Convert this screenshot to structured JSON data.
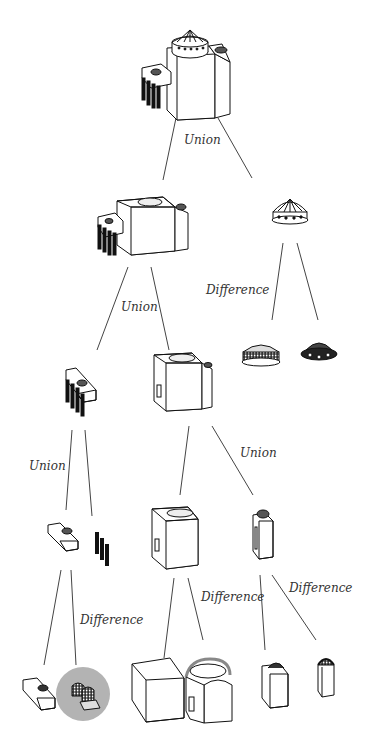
{
  "diagram": {
    "type": "csg-tree",
    "colors": {
      "line": "#444444",
      "ink": "#111111",
      "highlight": "#b3b3b3"
    },
    "operations": [
      {
        "id": "op-root",
        "label": "Union"
      },
      {
        "id": "op-a",
        "label": "Union"
      },
      {
        "id": "op-dome",
        "label": "Difference"
      },
      {
        "id": "op-porch",
        "label": "Union"
      },
      {
        "id": "op-main",
        "label": "Union"
      },
      {
        "id": "op-cube",
        "label": "Difference"
      },
      {
        "id": "op-tower",
        "label": "Difference"
      },
      {
        "id": "op-wing",
        "label": "Difference"
      }
    ],
    "nodes": [
      "full-building",
      "building-without-dome",
      "dome-drum",
      "solid-dome",
      "hollow-dome-cutter",
      "porch-with-columns",
      "main-block",
      "porch-block",
      "column-row",
      "hollowed-cube",
      "stair-tower",
      "wing-block",
      "wing-cutter-highlighted",
      "solid-cube",
      "vaulted-cutter",
      "tower-block",
      "tower-cutter"
    ]
  }
}
